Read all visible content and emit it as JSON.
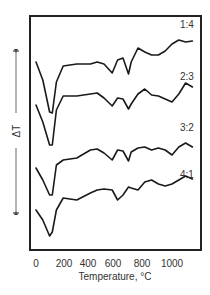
{
  "chart_data": {
    "type": "line",
    "title": "",
    "xlabel": "Temperature, °C",
    "ylabel": "ΔT",
    "xlim": [
      0,
      1150
    ],
    "x_ticks": [
      0,
      200,
      400,
      600,
      800,
      1000
    ],
    "x_tick_labels": [
      "0",
      "200",
      "400",
      "600",
      "800",
      "1000"
    ],
    "grid": false,
    "legend": "inline labels at right end of each curve",
    "y_axis_note": "no numeric scale; curves vertically offset (DTA curves)",
    "series": [
      {
        "name": "1:4",
        "x": [
          0,
          50,
          100,
          120,
          150,
          200,
          300,
          400,
          450,
          500,
          560,
          600,
          640,
          680,
          700,
          750,
          800,
          850,
          900,
          950,
          1000,
          1050,
          1100,
          1150
        ],
        "y": [
          62,
          80,
          112,
          113,
          82,
          66,
          64,
          64,
          62,
          64,
          73,
          60,
          58,
          74,
          62,
          48,
          52,
          55,
          55,
          51,
          44,
          40,
          42,
          41
        ]
      },
      {
        "name": "2:3",
        "x": [
          0,
          50,
          100,
          120,
          150,
          200,
          300,
          400,
          450,
          500,
          560,
          600,
          640,
          680,
          700,
          750,
          800,
          850,
          900,
          950,
          1000,
          1050,
          1100,
          1150
        ],
        "y": [
          105,
          122,
          145,
          145,
          110,
          96,
          96,
          94,
          93,
          98,
          106,
          98,
          99,
          109,
          104,
          94,
          89,
          95,
          96,
          99,
          102,
          94,
          83,
          87
        ]
      },
      {
        "name": "3:2",
        "x": [
          0,
          50,
          100,
          120,
          150,
          200,
          300,
          400,
          450,
          500,
          560,
          600,
          640,
          680,
          700,
          750,
          800,
          850,
          900,
          950,
          1000,
          1050,
          1100,
          1150
        ],
        "y": [
          168,
          180,
          195,
          195,
          165,
          160,
          158,
          150,
          149,
          153,
          160,
          150,
          151,
          161,
          152,
          148,
          147,
          150,
          148,
          150,
          155,
          147,
          143,
          147
        ]
      },
      {
        "name": "4:1",
        "x": [
          0,
          50,
          100,
          120,
          150,
          200,
          300,
          400,
          450,
          500,
          560,
          600,
          640,
          680,
          700,
          750,
          800,
          850,
          900,
          950,
          1000,
          1050,
          1100,
          1150
        ],
        "y": [
          210,
          220,
          236,
          232,
          210,
          198,
          200,
          193,
          190,
          189,
          190,
          200,
          195,
          187,
          188,
          190,
          182,
          180,
          184,
          186,
          184,
          180,
          176,
          179
        ]
      }
    ]
  },
  "labels": {
    "xlabel": "Temperature, °C",
    "ylabel": "ΔT",
    "ticks": [
      "0",
      "200",
      "400",
      "600",
      "800",
      "1000"
    ],
    "series": [
      "1:4",
      "2:3",
      "3:2",
      "4:1"
    ]
  }
}
